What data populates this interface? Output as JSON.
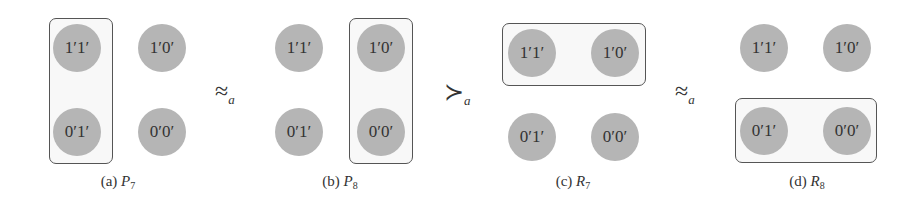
{
  "figure": {
    "panels": [
      {
        "id": "a",
        "caption_label": "(a)",
        "caption_symbol": "P",
        "caption_subscript": "7",
        "nodes": {
          "top_left": "1′1′",
          "top_right": "1′0′",
          "bottom_left": "0′1′",
          "bottom_right": "0′0′"
        },
        "grouping": "left-column"
      },
      {
        "id": "b",
        "caption_label": "(b)",
        "caption_symbol": "P",
        "caption_subscript": "8",
        "nodes": {
          "top_left": "1′1′",
          "top_right": "1′0′",
          "bottom_left": "0′1′",
          "bottom_right": "0′0′"
        },
        "grouping": "right-column"
      },
      {
        "id": "c",
        "caption_label": "(c)",
        "caption_symbol": "R",
        "caption_subscript": "7",
        "nodes": {
          "top_left": "1′1′",
          "top_right": "1′0′",
          "bottom_left": "0′1′",
          "bottom_right": "0′0′"
        },
        "grouping": "top-row"
      },
      {
        "id": "d",
        "caption_label": "(d)",
        "caption_symbol": "R",
        "caption_subscript": "8",
        "nodes": {
          "top_left": "1′1′",
          "top_right": "1′0′",
          "bottom_left": "0′1′",
          "bottom_right": "0′0′"
        },
        "grouping": "bottom-row"
      }
    ],
    "relations": [
      {
        "symbol": "≈",
        "subscript": "a"
      },
      {
        "symbol": "≻",
        "subscript": "a"
      },
      {
        "symbol": "≈",
        "subscript": "a"
      }
    ],
    "colors": {
      "node_fill": "#b5b5b5",
      "group_border": "#555555",
      "text": "#333333"
    }
  }
}
